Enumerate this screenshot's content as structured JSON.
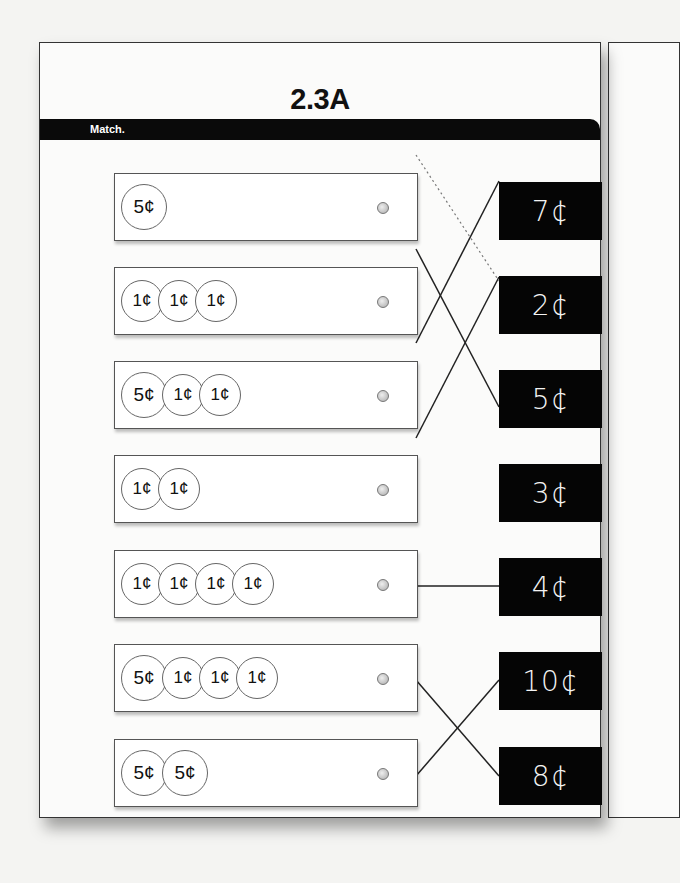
{
  "worksheet": {
    "title": "2.3A",
    "instruction": "Match.",
    "left_items": [
      {
        "coins": [
          "5¢"
        ],
        "total": "5¢"
      },
      {
        "coins": [
          "1¢",
          "1¢",
          "1¢"
        ],
        "total": "3¢"
      },
      {
        "coins": [
          "5¢",
          "1¢",
          "1¢"
        ],
        "total": "7¢"
      },
      {
        "coins": [
          "1¢",
          "1¢"
        ],
        "total": "2¢"
      },
      {
        "coins": [
          "1¢",
          "1¢",
          "1¢",
          "1¢"
        ],
        "total": "4¢"
      },
      {
        "coins": [
          "5¢",
          "1¢",
          "1¢",
          "1¢"
        ],
        "total": "8¢"
      },
      {
        "coins": [
          "5¢",
          "5¢"
        ],
        "total": "10¢"
      }
    ],
    "right_items": [
      "7¢",
      "2¢",
      "5¢",
      "3¢",
      "4¢",
      "10¢",
      "8¢"
    ],
    "matches": [
      {
        "from": 0,
        "to": 2,
        "style": "dotted"
      },
      {
        "from": 1,
        "to": 3,
        "style": "solid"
      },
      {
        "from": 2,
        "to": 0,
        "style": "solid"
      },
      {
        "from": 3,
        "to": 1,
        "style": "solid"
      },
      {
        "from": 4,
        "to": 4,
        "style": "solid"
      },
      {
        "from": 5,
        "to": 6,
        "style": "solid"
      },
      {
        "from": 6,
        "to": 5,
        "style": "solid"
      }
    ]
  }
}
